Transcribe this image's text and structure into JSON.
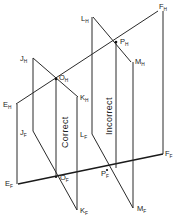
{
  "diagram": {
    "type": "descriptive-geometry-projection",
    "line_color": "#222222",
    "background": "#ffffff",
    "vertical_labels": {
      "left": "Correct",
      "right": "Incorrect"
    },
    "points": {
      "E_H": {
        "base": "E",
        "sub": "H"
      },
      "F_H": {
        "base": "F",
        "sub": "H"
      },
      "J_H": {
        "base": "J",
        "sub": "H"
      },
      "K_H": {
        "base": "K",
        "sub": "H"
      },
      "O_H": {
        "base": "O",
        "sub": "H"
      },
      "L_H": {
        "base": "L",
        "sub": "H"
      },
      "M_H": {
        "base": "M",
        "sub": "H"
      },
      "P_H": {
        "base": "P",
        "sub": "H"
      },
      "E_F": {
        "base": "E",
        "sub": "F"
      },
      "F_F": {
        "base": "F",
        "sub": "F"
      },
      "J_F": {
        "base": "J",
        "sub": "F"
      },
      "K_F": {
        "base": "K",
        "sub": "F"
      },
      "O_F": {
        "base": "O",
        "sub": "F"
      },
      "L_F": {
        "base": "L",
        "sub": "F"
      },
      "M_F": {
        "base": "M",
        "sub": "F"
      },
      "P_F": {
        "base": "P",
        "sub": "F"
      }
    }
  }
}
